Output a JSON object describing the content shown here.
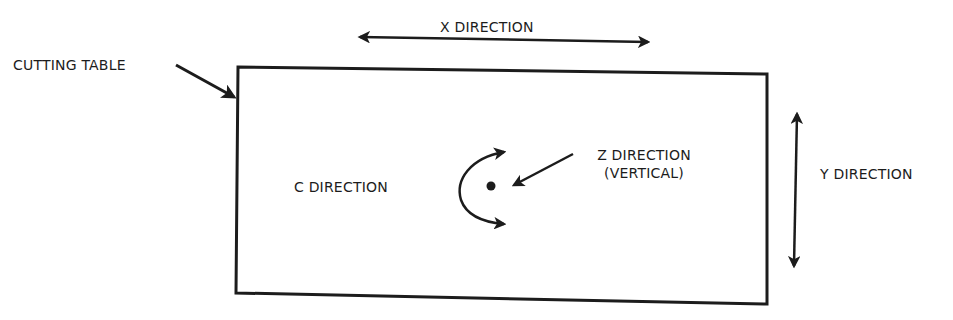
{
  "diagram": {
    "type": "axis-orientation-diagram",
    "colors": {
      "ink": "#1c1c1c",
      "background": "#ffffff"
    },
    "labels": {
      "cutting_table": "CUTTING TABLE",
      "x_direction": "X DIRECTION",
      "y_direction": "Y DIRECTION",
      "z_direction_line1": "Z DIRECTION",
      "z_direction_line2": "(VERTICAL)",
      "c_direction": "C DIRECTION"
    },
    "elements": [
      {
        "id": "cutting-table",
        "shape": "rectangle",
        "label": "CUTTING TABLE"
      },
      {
        "id": "x-arrow",
        "shape": "double-arrow-horizontal",
        "label": "X DIRECTION"
      },
      {
        "id": "y-arrow",
        "shape": "double-arrow-vertical",
        "label": "Y DIRECTION"
      },
      {
        "id": "z-point",
        "shape": "dot",
        "label": "Z DIRECTION (VERTICAL)"
      },
      {
        "id": "c-arc",
        "shape": "curved-double-arrow",
        "label": "C DIRECTION"
      }
    ],
    "connections": [
      {
        "from": "CUTTING TABLE label",
        "to": "cutting-table",
        "type": "pointer-arrow"
      },
      {
        "from": "Z DIRECTION label",
        "to": "z-point",
        "type": "pointer-arrow"
      }
    ]
  }
}
